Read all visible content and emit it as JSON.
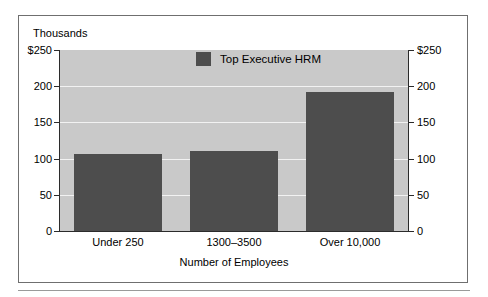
{
  "chart_data": {
    "type": "bar",
    "title": "",
    "subtitle": "",
    "unit_caption": "Thousands",
    "xlabel": "Number of Employees",
    "ylabel": "",
    "categories": [
      "Under 250",
      "1300–3500",
      "Over 10,000"
    ],
    "series": [
      {
        "name": "Top Executive HRM",
        "color": "#4d4d4d",
        "values": [
          106,
          111,
          192
        ]
      }
    ],
    "ylim": [
      0,
      250
    ],
    "yticks": [
      0,
      50,
      100,
      150,
      200,
      250
    ],
    "ytick_labels_left": [
      "0",
      "50",
      "100",
      "150",
      "200",
      "$250"
    ],
    "ytick_labels_right": [
      "0",
      "50",
      "100",
      "150",
      "200",
      "$250"
    ],
    "grid": true,
    "grid_color": "#f2f2f2",
    "plot_background": "#c9c9c9",
    "legend": {
      "position": "top-center",
      "entries": [
        {
          "label": "Top Executive HRM",
          "color": "#4d4d4d"
        }
      ]
    },
    "dual_axis": true
  }
}
